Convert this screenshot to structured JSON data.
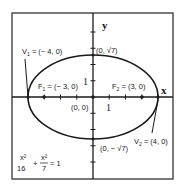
{
  "diagram": {
    "type": "ellipse",
    "equation": {
      "x_num": "x²",
      "x_den": "16",
      "plus": "+",
      "y_num": "x²",
      "y_den": "7",
      "rhs": "= 1"
    },
    "a": 4,
    "b_squared": 7,
    "axes": {
      "x_label": "x",
      "y_label": "y",
      "unit_label": "1",
      "x_unit_label": "1"
    },
    "points": {
      "V1": {
        "name": "V",
        "sub": "1",
        "text": " = (− 4, 0)",
        "x": -4,
        "y": 0
      },
      "V2": {
        "name": "V",
        "sub": "2",
        "text": " = (4, 0)",
        "x": 4,
        "y": 0
      },
      "F1": {
        "name": "F",
        "sub": "1",
        "text": " = (− 3, 0)",
        "x": -3,
        "y": 0
      },
      "F2": {
        "name": "F",
        "sub": "2",
        "text": " = (3, 0)",
        "x": 3,
        "y": 0
      },
      "top": {
        "text": "(0, √7)"
      },
      "bottom": {
        "text": "(0, − √7)"
      },
      "origin": {
        "text": "(0, 0)"
      }
    },
    "colors": {
      "stroke": "#1a1a1a",
      "frame": "#333333"
    }
  }
}
